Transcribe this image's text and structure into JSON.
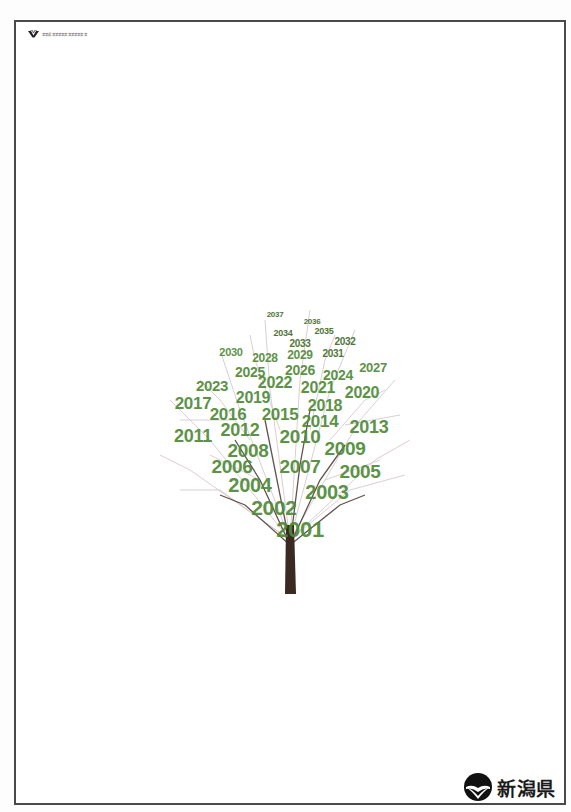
{
  "header": {
    "org_logo_icon": "niigata-org-v-mark-icon",
    "org_name": "某某県某某某某某某某某某某某"
  },
  "poster": {
    "tree_icon": "bare-tree-icon",
    "colors": {
      "year_text": "#4f8a38",
      "year_text_small": "#3f6b2a",
      "trunk": "#3b2a22",
      "branches": "#8a6f78",
      "frame": "#4a4a4a"
    },
    "years": [
      {
        "label": "2037",
        "x": 125,
        "y": 25,
        "size": 8
      },
      {
        "label": "2036",
        "x": 162,
        "y": 32,
        "size": 8
      },
      {
        "label": "2034",
        "x": 133,
        "y": 43,
        "size": 9
      },
      {
        "label": "2035",
        "x": 174,
        "y": 41,
        "size": 9
      },
      {
        "label": "2033",
        "x": 150,
        "y": 54,
        "size": 10
      },
      {
        "label": "2032",
        "x": 195,
        "y": 52,
        "size": 10
      },
      {
        "label": "2030",
        "x": 81,
        "y": 62,
        "size": 11
      },
      {
        "label": "2028",
        "x": 115,
        "y": 68,
        "size": 12
      },
      {
        "label": "2029",
        "x": 150,
        "y": 65,
        "size": 12
      },
      {
        "label": "2031",
        "x": 183,
        "y": 64,
        "size": 10
      },
      {
        "label": "2025",
        "x": 100,
        "y": 82,
        "size": 14
      },
      {
        "label": "2026",
        "x": 150,
        "y": 80,
        "size": 14
      },
      {
        "label": "2024",
        "x": 188,
        "y": 85,
        "size": 14
      },
      {
        "label": "2027",
        "x": 223,
        "y": 77,
        "size": 13
      },
      {
        "label": "2023",
        "x": 62,
        "y": 95,
        "size": 15
      },
      {
        "label": "2022",
        "x": 125,
        "y": 93,
        "size": 16
      },
      {
        "label": "2021",
        "x": 168,
        "y": 98,
        "size": 16
      },
      {
        "label": "2020",
        "x": 212,
        "y": 103,
        "size": 16
      },
      {
        "label": "2017",
        "x": 43,
        "y": 113,
        "size": 17
      },
      {
        "label": "2019",
        "x": 103,
        "y": 108,
        "size": 16
      },
      {
        "label": "2018",
        "x": 175,
        "y": 116,
        "size": 16
      },
      {
        "label": "2016",
        "x": 78,
        "y": 124,
        "size": 17
      },
      {
        "label": "2015",
        "x": 130,
        "y": 124,
        "size": 17
      },
      {
        "label": "2014",
        "x": 170,
        "y": 131,
        "size": 17
      },
      {
        "label": "2013",
        "x": 219,
        "y": 137,
        "size": 18
      },
      {
        "label": "2011",
        "x": 43,
        "y": 146,
        "size": 18
      },
      {
        "label": "2012",
        "x": 90,
        "y": 140,
        "size": 18
      },
      {
        "label": "2010",
        "x": 150,
        "y": 146,
        "size": 19
      },
      {
        "label": "2008",
        "x": 98,
        "y": 160,
        "size": 19
      },
      {
        "label": "2009",
        "x": 195,
        "y": 158,
        "size": 19
      },
      {
        "label": "2006",
        "x": 82,
        "y": 176,
        "size": 19
      },
      {
        "label": "2007",
        "x": 150,
        "y": 176,
        "size": 19
      },
      {
        "label": "2005",
        "x": 210,
        "y": 181,
        "size": 19
      },
      {
        "label": "2004",
        "x": 100,
        "y": 195,
        "size": 20
      },
      {
        "label": "2003",
        "x": 177,
        "y": 202,
        "size": 20
      },
      {
        "label": "2002",
        "x": 124,
        "y": 217,
        "size": 21
      },
      {
        "label": "2001",
        "x": 150,
        "y": 240,
        "size": 22
      }
    ]
  },
  "footer": {
    "brand_icon": "niigata-prefecture-emblem-icon",
    "brand_name": "新潟県"
  }
}
